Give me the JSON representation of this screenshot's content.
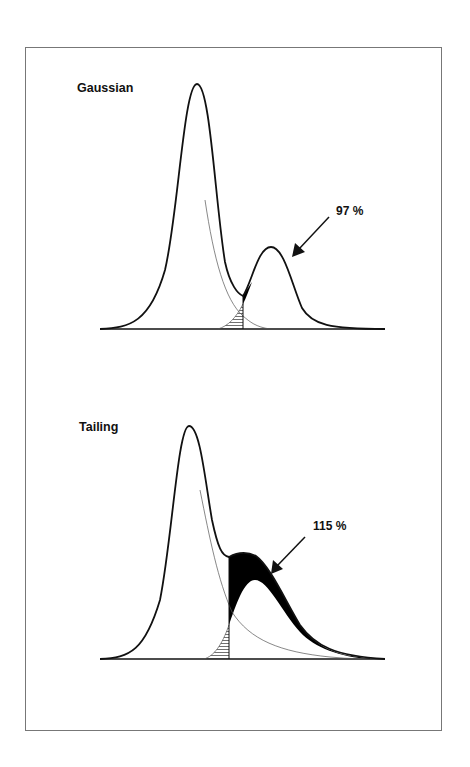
{
  "panels": [
    {
      "title": "Gaussian",
      "annotation": "97 %",
      "description": "Two Gaussian peaks partially overlapping; dropped perpendicular at valley; hatched area = tail of first peak cut off, black area = extra area attributed to second peak"
    },
    {
      "title": "Tailing",
      "annotation": "115 %",
      "description": "Tailing main peak with small second peak on its tail; perpendicular drop causes second peak area to be overestimated (black region)"
    }
  ],
  "legend": {
    "hatched": "area of first peak lost to second peak",
    "black": "area of first peak gained by second peak"
  },
  "colors": {
    "line": "#111111",
    "thin_line": "#555555",
    "frame": "#777777",
    "fill": "#000000"
  }
}
